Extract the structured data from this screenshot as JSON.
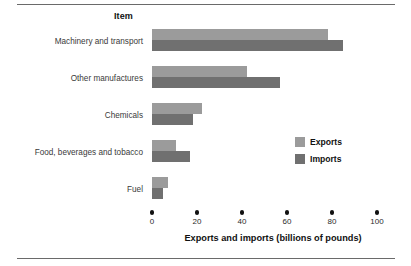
{
  "figure": {
    "title": "Item",
    "top_rule": true,
    "bottom_rule": true
  },
  "legend": {
    "position": "inside-right",
    "entries": [
      {
        "label": "Exports",
        "color": "#9b9b9b",
        "swatch_name": "legend-swatch-exports"
      },
      {
        "label": "Imports",
        "color": "#707070",
        "swatch_name": "legend-swatch-imports"
      }
    ]
  },
  "axis": {
    "x_title": "Exports and imports (billions of pounds)",
    "x_ticks": [
      "0",
      "20",
      "40",
      "60",
      "80",
      "100"
    ],
    "x_min": 0,
    "x_max": 100,
    "y_title": "Item"
  },
  "chart_data": {
    "type": "bar",
    "orientation": "horizontal",
    "title": "Item",
    "xlabel": "Exports and imports (billions of pounds)",
    "ylabel": "Item",
    "xlim": [
      0,
      100
    ],
    "xticks": [
      0,
      20,
      40,
      60,
      80,
      100
    ],
    "grid": false,
    "legend_position": "inside-right",
    "categories": [
      "Machinery and transport",
      "Other manufactures",
      "Chemicals",
      "Food, beverages and tobacco",
      "Fuel"
    ],
    "series": [
      {
        "name": "Exports",
        "color": "#9b9b9b",
        "values": [
          78,
          42,
          22,
          10.5,
          7
        ]
      },
      {
        "name": "Imports",
        "color": "#707070",
        "values": [
          85,
          57,
          18,
          17,
          5
        ]
      }
    ]
  }
}
